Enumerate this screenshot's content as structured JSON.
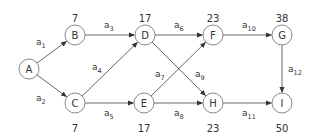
{
  "diagram": {
    "type": "activity-network",
    "nodes": [
      {
        "id": "A",
        "label": "A",
        "x": 29,
        "y": 69,
        "time": null
      },
      {
        "id": "B",
        "label": "B",
        "x": 75,
        "y": 35,
        "time": "7",
        "time_pos": "top"
      },
      {
        "id": "C",
        "label": "C",
        "x": 75,
        "y": 103,
        "time": "7",
        "time_pos": "bottom"
      },
      {
        "id": "D",
        "label": "D",
        "x": 145,
        "y": 35,
        "time": "17",
        "time_pos": "top"
      },
      {
        "id": "E",
        "label": "E",
        "x": 144,
        "y": 103,
        "time": "17",
        "time_pos": "bottom"
      },
      {
        "id": "F",
        "label": "F",
        "x": 213,
        "y": 35,
        "time": "23",
        "time_pos": "top"
      },
      {
        "id": "G",
        "label": "G",
        "x": 282,
        "y": 35,
        "time": "38",
        "time_pos": "top"
      },
      {
        "id": "H",
        "label": "H",
        "x": 213,
        "y": 103,
        "time": "23",
        "time_pos": "bottom"
      },
      {
        "id": "I",
        "label": "I",
        "x": 282,
        "y": 103,
        "time": "50",
        "time_pos": "bottom"
      }
    ],
    "edges": [
      {
        "from": "A",
        "to": "B",
        "base": "a",
        "sub": "1",
        "lx": 36,
        "ly": 45
      },
      {
        "from": "A",
        "to": "C",
        "base": "a",
        "sub": "2",
        "lx": 36,
        "ly": 101
      },
      {
        "from": "B",
        "to": "D",
        "base": "a",
        "sub": "3",
        "lx": 104,
        "ly": 28
      },
      {
        "from": "C",
        "to": "D",
        "base": "a",
        "sub": "4",
        "lx": 92,
        "ly": 70
      },
      {
        "from": "C",
        "to": "E",
        "base": "a",
        "sub": "5",
        "lx": 104,
        "ly": 116
      },
      {
        "from": "D",
        "to": "F",
        "base": "a",
        "sub": "6",
        "lx": 174,
        "ly": 28
      },
      {
        "from": "E",
        "to": "F",
        "base": "a",
        "sub": "7",
        "lx": 155,
        "ly": 77
      },
      {
        "from": "E",
        "to": "H",
        "base": "a",
        "sub": "8",
        "lx": 174,
        "ly": 116
      },
      {
        "from": "D",
        "to": "H",
        "base": "a",
        "sub": "9",
        "lx": 195,
        "ly": 77
      },
      {
        "from": "F",
        "to": "G",
        "base": "a",
        "sub": "10",
        "lx": 242,
        "ly": 28
      },
      {
        "from": "H",
        "to": "I",
        "base": "a",
        "sub": "11",
        "lx": 242,
        "ly": 116
      },
      {
        "from": "G",
        "to": "I",
        "base": "a",
        "sub": "12",
        "lx": 288,
        "ly": 72
      }
    ]
  }
}
